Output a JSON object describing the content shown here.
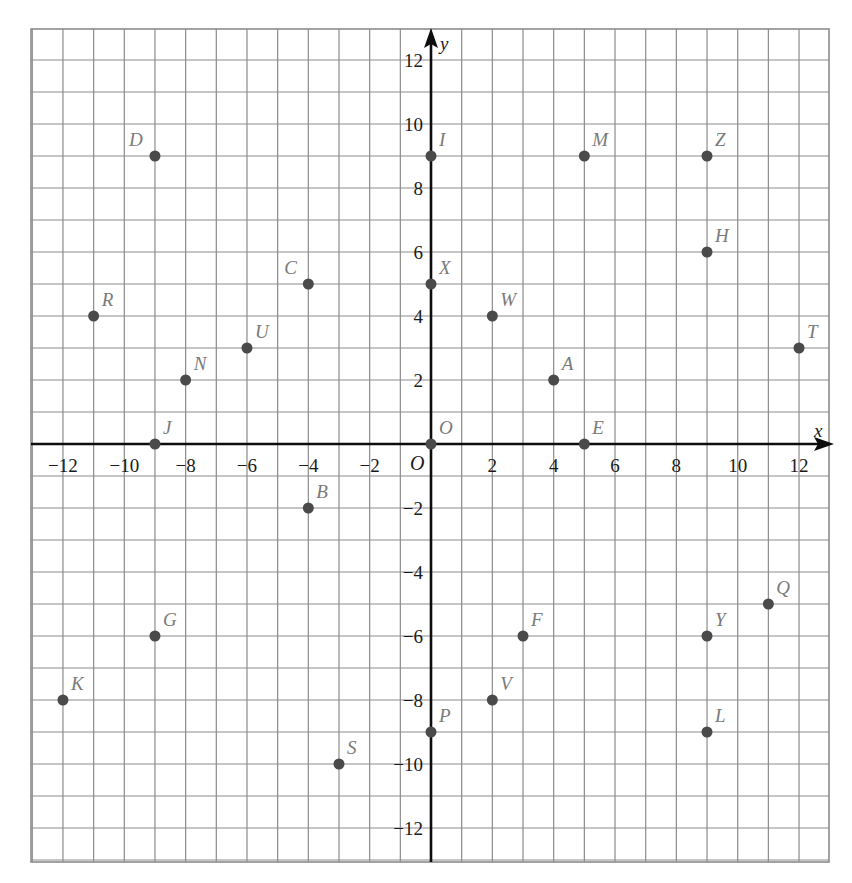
{
  "chart_data": {
    "type": "scatter",
    "title": "",
    "xlabel": "x",
    "ylabel": "y",
    "origin_label": "O",
    "xlim": [
      -13,
      13
    ],
    "ylim": [
      -13,
      13
    ],
    "grid": true,
    "x_ticks": [
      -12,
      -10,
      -8,
      -6,
      -4,
      -2,
      2,
      4,
      6,
      8,
      10,
      12
    ],
    "y_ticks": [
      12,
      10,
      8,
      6,
      4,
      2,
      -2,
      -4,
      -6,
      -8,
      -10,
      -12
    ],
    "x_tick_labels": [
      "−12",
      "−10",
      "−8",
      "−6",
      "−4",
      "−2",
      "2",
      "4",
      "6",
      "8",
      "10",
      "12"
    ],
    "y_tick_labels": [
      "12",
      "10",
      "8",
      "6",
      "4",
      "2",
      "−2",
      "−4",
      "−6",
      "−8",
      "−10",
      "−12"
    ],
    "points": [
      {
        "label": "A",
        "x": 4,
        "y": 2
      },
      {
        "label": "B",
        "x": -4,
        "y": -2
      },
      {
        "label": "C",
        "x": -4,
        "y": 5
      },
      {
        "label": "D",
        "x": -9,
        "y": 9
      },
      {
        "label": "E",
        "x": 5,
        "y": 0
      },
      {
        "label": "F",
        "x": 3,
        "y": -6
      },
      {
        "label": "G",
        "x": -9,
        "y": -6
      },
      {
        "label": "H",
        "x": 9,
        "y": 6
      },
      {
        "label": "I",
        "x": 0,
        "y": 9
      },
      {
        "label": "J",
        "x": -9,
        "y": 0
      },
      {
        "label": "K",
        "x": -12,
        "y": -8
      },
      {
        "label": "L",
        "x": 9,
        "y": -9
      },
      {
        "label": "M",
        "x": 5,
        "y": 9
      },
      {
        "label": "N",
        "x": -8,
        "y": 2
      },
      {
        "label": "O",
        "x": 0,
        "y": 0
      },
      {
        "label": "P",
        "x": 0,
        "y": -9
      },
      {
        "label": "Q",
        "x": 11,
        "y": -5
      },
      {
        "label": "R",
        "x": -11,
        "y": 4
      },
      {
        "label": "S",
        "x": -3,
        "y": -10
      },
      {
        "label": "T",
        "x": 12,
        "y": 3
      },
      {
        "label": "U",
        "x": -6,
        "y": 3
      },
      {
        "label": "V",
        "x": 2,
        "y": -8
      },
      {
        "label": "W",
        "x": 2,
        "y": 4
      },
      {
        "label": "X",
        "x": 0,
        "y": 5
      },
      {
        "label": "Y",
        "x": 9,
        "y": -6
      },
      {
        "label": "Z",
        "x": 9,
        "y": 9
      }
    ],
    "label_offsets": {
      "D": [
        -26,
        -10
      ],
      "C": [
        -24,
        -10
      ]
    },
    "colors": {
      "grid": "#8c8c8c",
      "axis": "#0d0d0d",
      "dot": "#4a4a4a",
      "point_label": "#7a7a7a"
    }
  }
}
